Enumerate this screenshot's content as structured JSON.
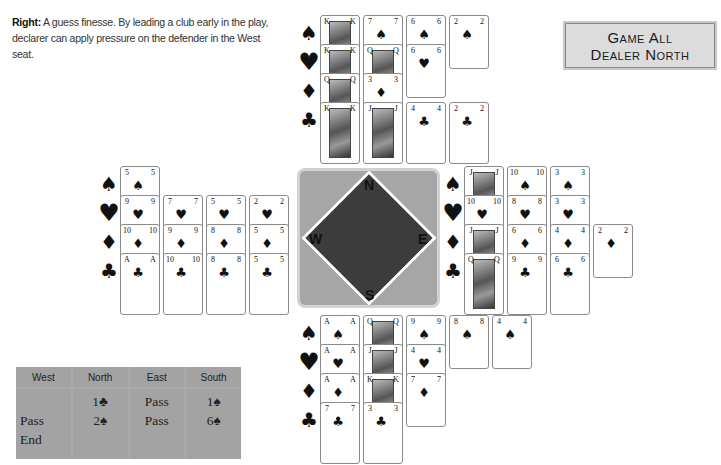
{
  "caption": {
    "label": "Right:",
    "text": "A guess finesse. By leading a club early in the play, declarer can apply pressure on the defender in the West seat."
  },
  "banner": {
    "line1": "Game All",
    "line2": "Dealer North"
  },
  "suit_symbols": {
    "spades": "♠",
    "hearts": "♥",
    "diamonds": "♦",
    "clubs": "♣"
  },
  "hands": {
    "north": {
      "spades": [
        "K",
        "7",
        "6",
        "2"
      ],
      "hearts": [
        "K",
        "Q",
        "6"
      ],
      "diamonds": [
        "Q",
        "3"
      ],
      "clubs": [
        "K",
        "J",
        "4",
        "2"
      ]
    },
    "west": {
      "spades": [
        "5"
      ],
      "hearts": [
        "9",
        "7",
        "5",
        "2"
      ],
      "diamonds": [
        "10",
        "9",
        "8",
        "5"
      ],
      "clubs": [
        "A",
        "10",
        "8",
        "5"
      ]
    },
    "east": {
      "spades": [
        "J",
        "10",
        "3"
      ],
      "hearts": [
        "10",
        "8",
        "3"
      ],
      "diamonds": [
        "J",
        "6",
        "4",
        "2"
      ],
      "clubs": [
        "Q",
        "9",
        "6"
      ]
    },
    "south": {
      "spades": [
        "A",
        "Q",
        "9",
        "8",
        "4"
      ],
      "hearts": [
        "A",
        "J",
        "4"
      ],
      "diamonds": [
        "A",
        "K",
        "7"
      ],
      "clubs": [
        "7",
        "3"
      ]
    }
  },
  "compass": {
    "north": "N",
    "south": "S",
    "east": "E",
    "west": "W",
    "colors": {
      "outer": "#a6a6a6",
      "diamond": "#3c3c3c"
    }
  },
  "bidding": {
    "headers": [
      "West",
      "North",
      "East",
      "South"
    ],
    "columns": {
      "west": [
        "",
        "Pass",
        "End"
      ],
      "north": [
        "1♣",
        "2♠",
        ""
      ],
      "east": [
        "Pass",
        "Pass",
        ""
      ],
      "south": [
        "1♠",
        "6♠",
        ""
      ]
    }
  }
}
